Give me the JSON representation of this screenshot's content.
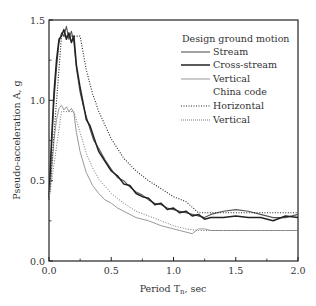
{
  "chart_data": {
    "type": "line",
    "title": "",
    "xlabel": "Period T",
    "xlabel_subscript": "n",
    "xlabel_suffix": ", sec",
    "ylabel": "Pseudo-acceleration A, g",
    "xlim": [
      0.0,
      2.0
    ],
    "ylim": [
      0.0,
      1.5
    ],
    "xticks": [
      "0.0",
      "0.5",
      "1.0",
      "1.5",
      "2.0"
    ],
    "yticks": [
      "0.0",
      "0.5",
      "1.0",
      "1.5"
    ],
    "grid": false,
    "legend_position": "upper right",
    "legend": {
      "group1_title": "Design ground motion",
      "group2_title": "China code",
      "entries": [
        "Stream",
        "Cross-stream",
        "Vertical",
        "Horizontal",
        "Vertical"
      ]
    },
    "series": [
      {
        "name": "Stream",
        "group": "Design ground motion",
        "style": "solid",
        "color": "#555555",
        "width": 1.1,
        "x": [
          0.0,
          0.02,
          0.04,
          0.06,
          0.08,
          0.1,
          0.12,
          0.14,
          0.16,
          0.18,
          0.2,
          0.22,
          0.25,
          0.28,
          0.3,
          0.33,
          0.36,
          0.4,
          0.45,
          0.5,
          0.55,
          0.6,
          0.65,
          0.7,
          0.75,
          0.8,
          0.85,
          0.9,
          0.95,
          1.0,
          1.05,
          1.1,
          1.15,
          1.2,
          1.25,
          1.3,
          1.4,
          1.5,
          1.6,
          1.7,
          1.8,
          1.9,
          2.0
        ],
        "y": [
          0.38,
          0.7,
          1.0,
          1.2,
          1.36,
          1.42,
          1.4,
          1.46,
          1.38,
          1.43,
          1.36,
          1.2,
          1.05,
          0.95,
          0.9,
          0.82,
          0.75,
          0.7,
          0.63,
          0.57,
          0.52,
          0.5,
          0.46,
          0.43,
          0.41,
          0.38,
          0.36,
          0.35,
          0.33,
          0.32,
          0.31,
          0.3,
          0.29,
          0.28,
          0.27,
          0.29,
          0.31,
          0.32,
          0.31,
          0.29,
          0.27,
          0.27,
          0.29
        ]
      },
      {
        "name": "Cross-stream",
        "group": "Design ground motion",
        "style": "solid",
        "color": "#222222",
        "width": 1.5,
        "x": [
          0.0,
          0.02,
          0.04,
          0.06,
          0.08,
          0.1,
          0.12,
          0.14,
          0.16,
          0.18,
          0.2,
          0.22,
          0.25,
          0.28,
          0.3,
          0.33,
          0.36,
          0.4,
          0.45,
          0.5,
          0.55,
          0.6,
          0.65,
          0.7,
          0.75,
          0.8,
          0.85,
          0.9,
          0.95,
          1.0,
          1.05,
          1.1,
          1.15,
          1.2,
          1.25,
          1.3,
          1.4,
          1.5,
          1.6,
          1.7,
          1.8,
          1.9,
          2.0
        ],
        "y": [
          0.38,
          0.75,
          1.05,
          1.25,
          1.38,
          1.4,
          1.44,
          1.38,
          1.42,
          1.36,
          1.4,
          1.22,
          1.08,
          0.96,
          0.88,
          0.84,
          0.77,
          0.68,
          0.62,
          0.56,
          0.53,
          0.48,
          0.47,
          0.42,
          0.4,
          0.39,
          0.35,
          0.36,
          0.32,
          0.33,
          0.3,
          0.31,
          0.28,
          0.29,
          0.26,
          0.27,
          0.27,
          0.28,
          0.27,
          0.27,
          0.25,
          0.28,
          0.27
        ]
      },
      {
        "name": "Vertical",
        "group": "Design ground motion",
        "style": "solid",
        "color": "#999999",
        "width": 1.0,
        "x": [
          0.0,
          0.02,
          0.04,
          0.06,
          0.08,
          0.1,
          0.12,
          0.14,
          0.16,
          0.18,
          0.2,
          0.22,
          0.25,
          0.28,
          0.3,
          0.35,
          0.4,
          0.45,
          0.5,
          0.55,
          0.6,
          0.65,
          0.7,
          0.8,
          0.9,
          1.0,
          1.1,
          1.15,
          1.2,
          1.25,
          1.3,
          1.4,
          1.5,
          1.6,
          1.7,
          1.8,
          1.9,
          2.0
        ],
        "y": [
          0.38,
          0.55,
          0.75,
          0.88,
          0.95,
          0.97,
          0.94,
          0.96,
          0.93,
          0.95,
          0.92,
          0.8,
          0.68,
          0.6,
          0.55,
          0.47,
          0.42,
          0.38,
          0.36,
          0.33,
          0.31,
          0.29,
          0.27,
          0.25,
          0.22,
          0.2,
          0.18,
          0.17,
          0.2,
          0.2,
          0.19,
          0.19,
          0.19,
          0.19,
          0.19,
          0.19,
          0.19,
          0.19
        ]
      },
      {
        "name": "Horizontal",
        "group": "China code",
        "style": "dotted",
        "color": "#222222",
        "width": 1.1,
        "x": [
          0.0,
          0.1,
          0.25,
          0.3,
          0.35,
          0.4,
          0.5,
          0.6,
          0.7,
          0.8,
          0.9,
          1.0,
          1.1,
          1.2,
          1.4,
          1.6,
          1.8,
          2.0
        ],
        "y": [
          0.38,
          1.4,
          1.4,
          1.19,
          1.04,
          0.93,
          0.76,
          0.64,
          0.56,
          0.5,
          0.45,
          0.4,
          0.37,
          0.3,
          0.3,
          0.3,
          0.3,
          0.3
        ]
      },
      {
        "name": "Vertical",
        "group": "China code",
        "style": "dotted",
        "color": "#777777",
        "width": 1.0,
        "x": [
          0.0,
          0.1,
          0.2,
          0.25,
          0.3,
          0.35,
          0.4,
          0.5,
          0.6,
          0.7,
          0.8,
          0.9,
          1.0,
          1.1,
          1.2,
          1.4,
          1.6,
          1.8,
          2.0
        ],
        "y": [
          0.38,
          0.93,
          0.93,
          0.8,
          0.67,
          0.58,
          0.51,
          0.42,
          0.36,
          0.31,
          0.28,
          0.25,
          0.22,
          0.2,
          0.19,
          0.19,
          0.19,
          0.19,
          0.19
        ]
      }
    ]
  }
}
